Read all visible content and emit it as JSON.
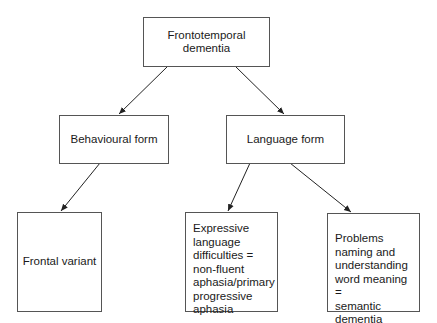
{
  "diagram": {
    "type": "hierarchy",
    "nodes": {
      "root": {
        "label": "Frontotemporal dementia"
      },
      "behavioural": {
        "label": "Behavioural form"
      },
      "language": {
        "label": "Language form"
      },
      "frontal": {
        "label": "Frontal variant"
      },
      "expressive": {
        "label": "Expressive\nlanguage\ndifficulties =\nnon-fluent\naphasia/primary\nprogressive\naphasia"
      },
      "semantic": {
        "label": "Problems\nnaming and\nunderstanding\nword meaning =\nsemantic\ndementia"
      }
    },
    "edges": [
      {
        "from": "Frontotemporal dementia",
        "to": "Behavioural form"
      },
      {
        "from": "Frontotemporal dementia",
        "to": "Language form"
      },
      {
        "from": "Behavioural form",
        "to": "Frontal variant"
      },
      {
        "from": "Language form",
        "to": "Expressive language difficulties = non-fluent aphasia/primary progressive aphasia"
      },
      {
        "from": "Language form",
        "to": "Problems naming and understanding word meaning = semantic dementia"
      }
    ],
    "colors": {
      "border": "#555555",
      "arrow": "#222222",
      "text": "#1a1a1a",
      "background": "#ffffff"
    }
  }
}
